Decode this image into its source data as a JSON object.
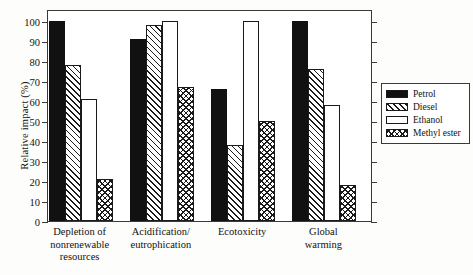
{
  "chart_data": {
    "type": "bar",
    "title": "",
    "xlabel": "",
    "ylabel": "Relative impact (%)",
    "ylim": [
      0,
      100
    ],
    "ytick_step": 10,
    "yticks": [
      0,
      10,
      20,
      30,
      40,
      50,
      60,
      70,
      80,
      90,
      100
    ],
    "grid": false,
    "legend_position": "right-outside",
    "categories": [
      "Depletion of\nnonrenewable\nresources",
      "Acidification/\neutrophication",
      "Ecotoxicity",
      "Global\nwarming"
    ],
    "series": [
      {
        "name": "Petrol",
        "pattern": "solid-black",
        "values": [
          100,
          91,
          66,
          100
        ]
      },
      {
        "name": "Diesel",
        "pattern": "diagonal-hatch",
        "values": [
          78,
          98,
          38,
          76
        ]
      },
      {
        "name": "Ethanol",
        "pattern": "white-empty",
        "values": [
          61,
          100,
          100,
          58
        ]
      },
      {
        "name": "Methyl ester",
        "pattern": "cross-hatch",
        "values": [
          21,
          67,
          50,
          18
        ]
      }
    ]
  },
  "axis": {
    "y_title": "Relative impact (%)"
  },
  "legend": {
    "items": [
      {
        "label": "Petrol"
      },
      {
        "label": "Diesel"
      },
      {
        "label": "Ethanol"
      },
      {
        "label": "Methyl ester"
      }
    ]
  },
  "colors": {
    "ink": "#111111",
    "frame": "#3a3a3a",
    "background": "#ffffff"
  }
}
